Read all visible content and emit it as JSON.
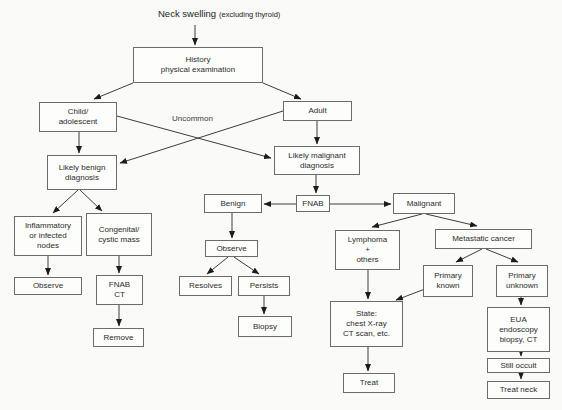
{
  "title": {
    "main": "Neck swelling",
    "qualifier": "(excluding thyroid)"
  },
  "labels": {
    "uncommon": "Uncommon"
  },
  "nodes": {
    "history": {
      "label": "History\nphysical examination"
    },
    "child": {
      "label": "Child/\nadolescent"
    },
    "adult": {
      "label": "Adult"
    },
    "benign_dx": {
      "label": "Likely benign\ndiagnosis"
    },
    "malignant_dx": {
      "label": "Likely malignant\ndiagnosis"
    },
    "inflammatory": {
      "label": "Inflammatory\nor infected\nnodes"
    },
    "congenital": {
      "label": "Congenital/\ncystic mass"
    },
    "observe_left": {
      "label": "Observe"
    },
    "fnab_ct": {
      "label": "FNAB\nCT"
    },
    "remove": {
      "label": "Remove"
    },
    "benign": {
      "label": "Benign"
    },
    "fnab": {
      "label": "FNAB"
    },
    "malignant": {
      "label": "Malignant"
    },
    "observe_mid": {
      "label": "Observe"
    },
    "resolves": {
      "label": "Resolves"
    },
    "persists": {
      "label": "Persists"
    },
    "biopsy": {
      "label": "Biopsy"
    },
    "lymphoma": {
      "label": "Lymphoma\n+\nothers"
    },
    "metastatic": {
      "label": "Metastatic cancer"
    },
    "primary_known": {
      "label": "Primary\nknown"
    },
    "primary_unknown": {
      "label": "Primary\nunknown"
    },
    "state": {
      "label": "State:\nchest X-ray\nCT scan, etc."
    },
    "treat": {
      "label": "Treat"
    },
    "eua": {
      "label": "EUA\nendoscopy\nbiopsy, CT"
    },
    "still_occult": {
      "label": "Still occult"
    },
    "treat_neck": {
      "label": "Treat neck"
    }
  },
  "edges": [
    {
      "from": "title",
      "to": "history"
    },
    {
      "from": "history",
      "to": "child"
    },
    {
      "from": "history",
      "to": "adult"
    },
    {
      "from": "child",
      "to": "benign_dx"
    },
    {
      "from": "adult",
      "to": "malignant_dx"
    },
    {
      "from": "child",
      "to": "malignant_dx",
      "label": "Uncommon"
    },
    {
      "from": "adult",
      "to": "benign_dx",
      "label": "Uncommon"
    },
    {
      "from": "benign_dx",
      "to": "inflammatory"
    },
    {
      "from": "benign_dx",
      "to": "congenital"
    },
    {
      "from": "inflammatory",
      "to": "observe_left"
    },
    {
      "from": "congenital",
      "to": "fnab_ct"
    },
    {
      "from": "fnab_ct",
      "to": "remove"
    },
    {
      "from": "malignant_dx",
      "to": "fnab"
    },
    {
      "from": "fnab",
      "to": "benign"
    },
    {
      "from": "fnab",
      "to": "malignant"
    },
    {
      "from": "benign",
      "to": "observe_mid"
    },
    {
      "from": "observe_mid",
      "to": "resolves"
    },
    {
      "from": "observe_mid",
      "to": "persists"
    },
    {
      "from": "persists",
      "to": "biopsy"
    },
    {
      "from": "malignant",
      "to": "lymphoma"
    },
    {
      "from": "malignant",
      "to": "metastatic"
    },
    {
      "from": "metastatic",
      "to": "primary_known"
    },
    {
      "from": "metastatic",
      "to": "primary_unknown"
    },
    {
      "from": "lymphoma",
      "to": "state"
    },
    {
      "from": "primary_known",
      "to": "state"
    },
    {
      "from": "state",
      "to": "treat"
    },
    {
      "from": "primary_unknown",
      "to": "eua"
    },
    {
      "from": "eua",
      "to": "still_occult"
    },
    {
      "from": "still_occult",
      "to": "treat_neck"
    }
  ],
  "colors": {
    "background": "#fafaf8",
    "box_fill": "#fdfdfc",
    "box_border": "#6b6b6b",
    "line": "#3d3d3d",
    "text": "#2b2b2b"
  }
}
